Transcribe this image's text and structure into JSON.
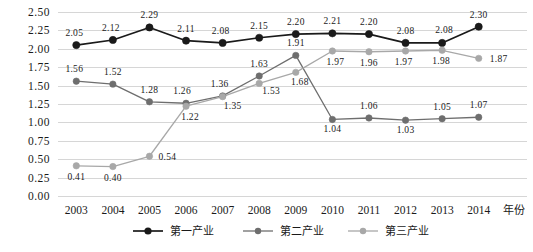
{
  "chart_data": {
    "type": "line",
    "title": "",
    "xlabel": "年份",
    "ylabel": "",
    "categories": [
      "2003",
      "2004",
      "2005",
      "2006",
      "2007",
      "2008",
      "2009",
      "2010",
      "2011",
      "2012",
      "2013",
      "2014"
    ],
    "ylim": [
      0.0,
      2.5
    ],
    "ytick_labels": [
      "0.00",
      "0.25",
      "0.50",
      "0.75",
      "1.00",
      "1.25",
      "1.50",
      "1.75",
      "2.00",
      "2.25",
      "2.50"
    ],
    "ytick_values": [
      0.0,
      0.25,
      0.5,
      0.75,
      1.0,
      1.25,
      1.5,
      1.75,
      2.0,
      2.25,
      2.5
    ],
    "grid": true,
    "legend_position": "bottom",
    "series": [
      {
        "name": "第一产业",
        "color": "#1a1a1a",
        "marker": "circle",
        "values": [
          2.05,
          2.12,
          2.29,
          2.11,
          2.08,
          2.15,
          2.2,
          2.21,
          2.2,
          2.08,
          2.08,
          2.3
        ],
        "labels": [
          "2.05",
          "2.12",
          "2.29",
          "2.11",
          "2.08",
          "2.15",
          "2.20",
          "2.21",
          "2.20",
          "2.08",
          "2.08",
          "2.30"
        ]
      },
      {
        "name": "第二产业",
        "color": "#6e6e6e",
        "marker": "circle",
        "values": [
          1.56,
          1.52,
          1.28,
          1.26,
          1.36,
          1.63,
          1.91,
          1.04,
          1.06,
          1.03,
          1.05,
          1.07
        ],
        "labels": [
          "1.56",
          "1.52",
          "1.28",
          "1.26",
          "1.36",
          "1.63",
          "1.91",
          "1.04",
          "1.06",
          "1.03",
          "1.05",
          "1.07"
        ]
      },
      {
        "name": "第三产业",
        "color": "#a8a8a8",
        "marker": "circle",
        "values": [
          0.41,
          0.4,
          0.54,
          1.22,
          1.35,
          1.53,
          1.68,
          1.97,
          1.96,
          1.97,
          1.98,
          1.87
        ],
        "labels": [
          "0.41",
          "0.40",
          "0.54",
          "1.22",
          "1.35",
          "1.53",
          "1.68",
          "1.97",
          "1.96",
          "1.97",
          "1.98",
          "1.87"
        ]
      }
    ],
    "label_offsets": [
      [
        -2,
        -9
      ],
      [
        -2,
        -9
      ],
      [
        0,
        -9
      ],
      [
        0,
        -9
      ],
      [
        -2,
        -9
      ],
      [
        0,
        -9
      ],
      [
        0,
        -9
      ],
      [
        0,
        -9
      ],
      [
        0,
        -9
      ],
      [
        0,
        -9
      ],
      [
        2,
        -10
      ],
      [
        0,
        -9
      ]
    ],
    "label_offsets_s2": [
      [
        -2,
        -9
      ],
      [
        0,
        -9
      ],
      [
        0,
        -9
      ],
      [
        -4,
        -9
      ],
      [
        -3,
        -9
      ],
      [
        0,
        -9
      ],
      [
        0,
        -9
      ],
      [
        0,
        13
      ],
      [
        0,
        -9
      ],
      [
        0,
        13
      ],
      [
        0,
        -9
      ],
      [
        0,
        -9
      ]
    ],
    "label_offsets_s3": [
      [
        0,
        14
      ],
      [
        0,
        14
      ],
      [
        18,
        4
      ],
      [
        4,
        14
      ],
      [
        10,
        12
      ],
      [
        12,
        11
      ],
      [
        4,
        13
      ],
      [
        3,
        14
      ],
      [
        0,
        14
      ],
      [
        -2,
        14
      ],
      [
        -1,
        14
      ],
      [
        20,
        4
      ]
    ]
  }
}
